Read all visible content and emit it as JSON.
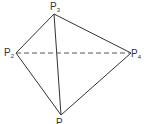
{
  "diagram": {
    "type": "tetrahedron",
    "line_color": "#333333",
    "vertices": [
      {
        "id": "P1",
        "label": "P",
        "subscript": "1",
        "x": 61,
        "y": 115
      },
      {
        "id": "P2",
        "label": "P",
        "subscript": "2",
        "x": 16,
        "y": 53
      },
      {
        "id": "P3",
        "label": "P",
        "subscript": "3",
        "x": 54,
        "y": 14
      },
      {
        "id": "P4",
        "label": "P",
        "subscript": "4",
        "x": 131,
        "y": 53
      }
    ],
    "edges": [
      {
        "from": "P3",
        "to": "P2",
        "style": "solid"
      },
      {
        "from": "P3",
        "to": "P4",
        "style": "solid"
      },
      {
        "from": "P3",
        "to": "P1",
        "style": "solid"
      },
      {
        "from": "P2",
        "to": "P1",
        "style": "solid"
      },
      {
        "from": "P4",
        "to": "P1",
        "style": "solid"
      },
      {
        "from": "P2",
        "to": "P4",
        "style": "dashed"
      }
    ]
  }
}
